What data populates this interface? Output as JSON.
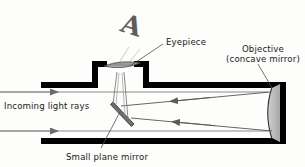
{
  "figure": {
    "kind": "newtonian-reflecting-telescope-diagram",
    "background_color": "#fdfdfb",
    "ink_color": "#000000",
    "ray_color": "#555555"
  },
  "labels": {
    "eyepiece": "Eyepiece",
    "objective_line1": "Objective",
    "objective_line2": "(concave mirror)",
    "incoming": "Incoming light rays",
    "plane_mirror": "Small plane mirror",
    "image_letter": "A"
  },
  "parts": {
    "tube": {
      "name": "telescope-tube",
      "wall_color": "#000000",
      "open_end": "left"
    },
    "objective_mirror": {
      "name": "concave-mirror",
      "fill": "#b9b9b9",
      "position": "right-end"
    },
    "plane_mirror": {
      "name": "diagonal-plane-mirror",
      "angle_deg": 45,
      "position": "center-tube"
    },
    "eyepiece_lens": {
      "name": "eyepiece-lens",
      "fill": "#9a9a9a",
      "position": "top-chimney"
    }
  },
  "rays": {
    "incoming_count": 2,
    "incoming_y": [
      92,
      131
    ],
    "reflected_count": 2,
    "direction_in": "right",
    "direction_reflected": "left"
  }
}
